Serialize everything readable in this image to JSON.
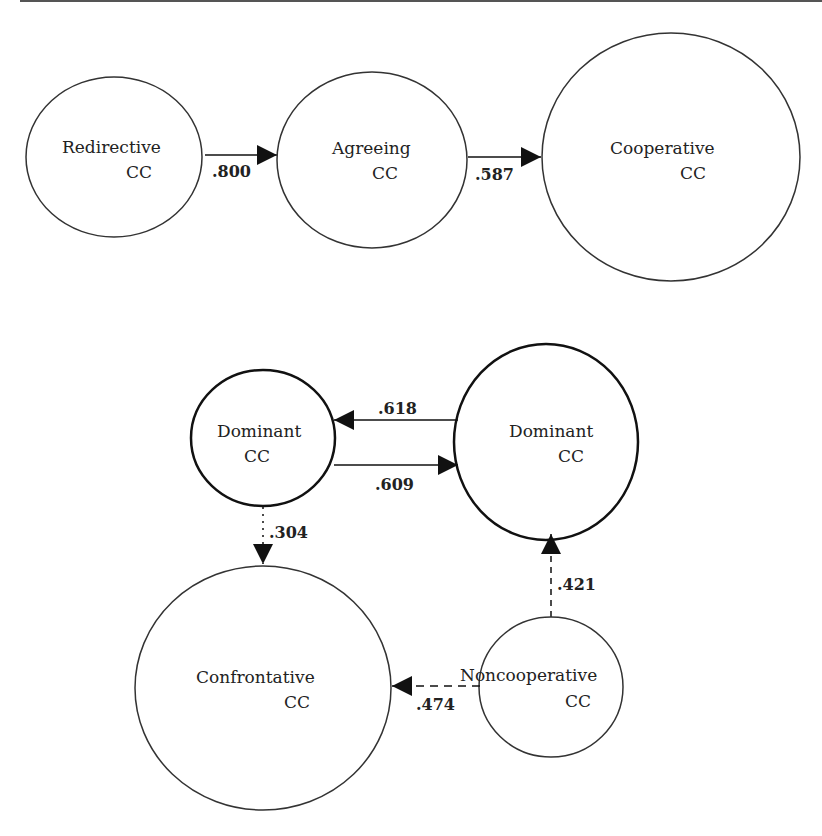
{
  "diagram": {
    "top_chain": {
      "nodes": [
        {
          "id": "redirective",
          "line1": "Redirective",
          "line2": "CC"
        },
        {
          "id": "agreeing",
          "line1": "Agreeing",
          "line2": "CC"
        },
        {
          "id": "cooperative",
          "line1": "Cooperative",
          "line2": "CC"
        }
      ],
      "edges": [
        {
          "from": "redirective",
          "to": "agreeing",
          "value": ".800",
          "style": "solid"
        },
        {
          "from": "agreeing",
          "to": "cooperative",
          "value": ".587",
          "style": "solid"
        }
      ]
    },
    "bottom_network": {
      "nodes": [
        {
          "id": "dominant-left",
          "line1": "Dominant",
          "line2": "CC"
        },
        {
          "id": "dominant-right",
          "line1": "Dominant",
          "line2": "CC"
        },
        {
          "id": "confrontative",
          "line1": "Confrontative",
          "line2": "CC"
        },
        {
          "id": "noncooperative",
          "line1": "Noncooperative",
          "line2": "CC"
        }
      ],
      "edges": [
        {
          "from": "dominant-right",
          "to": "dominant-left",
          "value": ".618",
          "style": "solid"
        },
        {
          "from": "dominant-left",
          "to": "dominant-right",
          "value": ".609",
          "style": "solid"
        },
        {
          "from": "dominant-left",
          "to": "confrontative",
          "value": ".304",
          "style": "dotted"
        },
        {
          "from": "noncooperative",
          "to": "dominant-right",
          "value": ".421",
          "style": "dashed"
        },
        {
          "from": "noncooperative",
          "to": "confrontative",
          "value": ".474",
          "style": "dashed"
        }
      ]
    }
  }
}
